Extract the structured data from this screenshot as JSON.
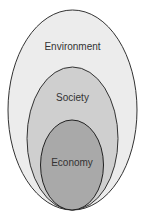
{
  "diagram": {
    "type": "nested-ellipses",
    "layers": [
      {
        "label": "Environment",
        "fill": "#ececec",
        "stroke": "#333333"
      },
      {
        "label": "Society",
        "fill": "#cfcfcf",
        "stroke": "#333333"
      },
      {
        "label": "Economy",
        "fill": "#a9a9a9",
        "stroke": "#222222"
      }
    ]
  }
}
